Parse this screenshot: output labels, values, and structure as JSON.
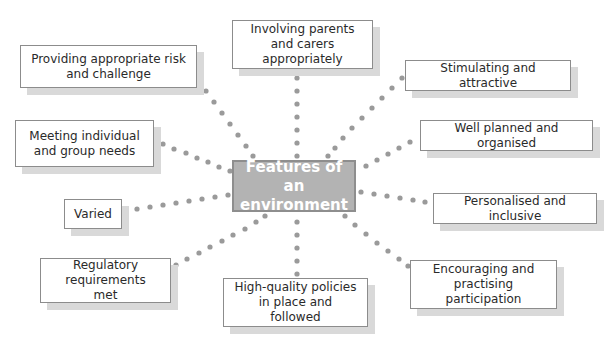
{
  "diagram": {
    "type": "mind-map",
    "dot_color": "#9a9a9a",
    "center": {
      "label": "Features of an environment",
      "fill": "#b3b3b3",
      "text_color": "#ffffff"
    },
    "features": [
      {
        "id": "risk",
        "label": "Providing appropriate risk and challenge"
      },
      {
        "id": "parents",
        "label": "Involving parents and carers appropriately"
      },
      {
        "id": "stimulating",
        "label": "Stimulating and attractive"
      },
      {
        "id": "planned",
        "label": "Well planned and organised"
      },
      {
        "id": "needs",
        "label": "Meeting individual and group needs"
      },
      {
        "id": "varied",
        "label": "Varied"
      },
      {
        "id": "personalised",
        "label": "Personalised and inclusive"
      },
      {
        "id": "regulatory",
        "label": "Regulatory requirements met"
      },
      {
        "id": "policies",
        "label": "High-quality policies in place and followed"
      },
      {
        "id": "participation",
        "label": "Encouraging and practising participation"
      }
    ]
  }
}
